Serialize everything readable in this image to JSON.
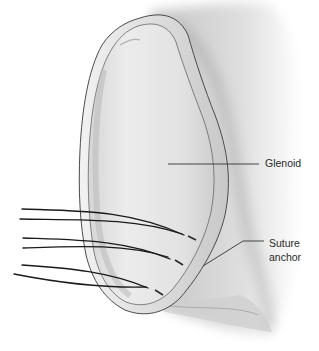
{
  "figure": {
    "style": "grayscale pencil medical illustration",
    "colors": {
      "background": "#ffffff",
      "bone_light": "#eeeeee",
      "bone_mid": "#d4d4d4",
      "bone_shadow": "#9a9a9a",
      "outline": "#4a4a4a",
      "suture": "#1a1a1a",
      "leader_line": "#333333",
      "label_text": "#2a2a2a"
    },
    "sutures": {
      "count_pairs": 3,
      "anchor_points": [
        [
          184,
          235
        ],
        [
          170,
          258
        ],
        [
          148,
          288
        ]
      ]
    }
  },
  "labels": {
    "glenoid": "Glenoid",
    "suture_anchor_line1": "Suture",
    "suture_anchor_line2": "anchor"
  }
}
